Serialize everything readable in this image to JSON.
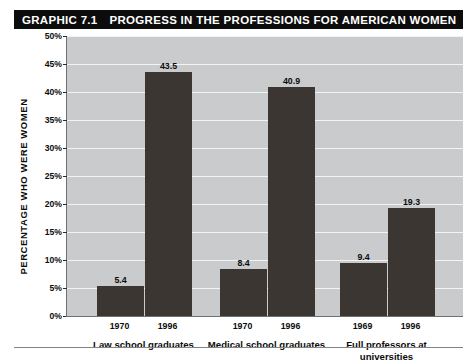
{
  "banner": {
    "graphic_number": "GRAPHIC 7.1",
    "title": "PROGRESS IN THE PROFESSIONS FOR AMERICAN WOMEN"
  },
  "chart_data": {
    "type": "bar",
    "title": "PROGRESS IN THE PROFESSIONS FOR AMERICAN WOMEN",
    "xlabel": "",
    "ylabel": "PERCENTAGE WHO WERE WOMEN",
    "ylim": [
      0,
      50
    ],
    "ytick_labels": [
      "50%",
      "45%",
      "40%",
      "35%",
      "30%",
      "25%",
      "20%",
      "15%",
      "10%",
      "5%",
      "0%"
    ],
    "ytick_values": [
      50,
      45,
      40,
      35,
      30,
      25,
      20,
      15,
      10,
      5,
      0
    ],
    "grid": true,
    "legend": "none",
    "bar_color": "#3c3633",
    "plot_background": "#c9cbcc",
    "gridline_color": "#f2f3f3",
    "groups": [
      {
        "name": "Law school graduates",
        "lines": [
          "Law school graduates"
        ],
        "bars": [
          {
            "year": "1970",
            "value": 5.4,
            "label": "5.4"
          },
          {
            "year": "1996",
            "value": 43.5,
            "label": "43.5"
          }
        ]
      },
      {
        "name": "Medical school graduates",
        "lines": [
          "Medical school graduates"
        ],
        "bars": [
          {
            "year": "1970",
            "value": 8.4,
            "label": "8.4"
          },
          {
            "year": "1996",
            "value": 40.9,
            "label": "40.9"
          }
        ]
      },
      {
        "name": "Full professors at universities",
        "lines": [
          "Full professors at",
          "universities"
        ],
        "bars": [
          {
            "year": "1969",
            "value": 9.4,
            "label": "9.4"
          },
          {
            "year": "1996",
            "value": 19.3,
            "label": "19.3"
          }
        ]
      }
    ]
  }
}
